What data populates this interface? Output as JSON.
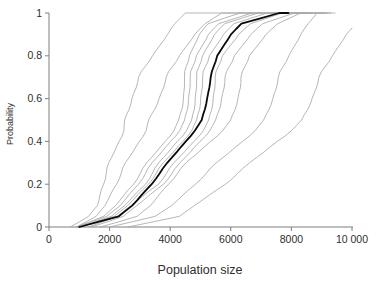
{
  "chart_data": {
    "type": "line",
    "subtype": "empirical-cdf",
    "title": "",
    "xlabel": "Population size",
    "ylabel": "Probability",
    "xlim": [
      0,
      10000
    ],
    "ylim": [
      0,
      1
    ],
    "grid": false,
    "legend": "none",
    "n_series": 12,
    "x_ticks": {
      "values": [
        0,
        2000,
        4000,
        6000,
        8000,
        10000
      ],
      "labels": [
        "0",
        "2000",
        "4000",
        "6000",
        "8000",
        "10 000"
      ]
    },
    "y_ticks": {
      "values": [
        0,
        0.2,
        0.4,
        0.6,
        0.8,
        1
      ],
      "labels": [
        "0",
        "0.2",
        "0.4",
        "0.6",
        "0.8",
        "1"
      ]
    },
    "series": [
      {
        "name": "replicate-1",
        "role": "replicate",
        "color": "#a3a3a3",
        "width": 0.8,
        "points": [
          [
            700,
            0
          ],
          [
            1300,
            0.05
          ],
          [
            1600,
            0.1
          ],
          [
            1815,
            0.2
          ],
          [
            2050,
            0.3
          ],
          [
            2280,
            0.4
          ],
          [
            2508,
            0.5
          ],
          [
            2750,
            0.6
          ],
          [
            3050,
            0.7
          ],
          [
            3400,
            0.8
          ],
          [
            3900,
            0.9
          ],
          [
            4150,
            0.95
          ],
          [
            4500,
            1
          ],
          [
            6700,
            1
          ]
        ]
      },
      {
        "name": "replicate-2",
        "role": "replicate",
        "color": "#a3a3a3",
        "width": 0.8,
        "points": [
          [
            900,
            0
          ],
          [
            1550,
            0.05
          ],
          [
            1850,
            0.1
          ],
          [
            2244,
            0.2
          ],
          [
            2600,
            0.3
          ],
          [
            2950,
            0.4
          ],
          [
            3300,
            0.5
          ],
          [
            3650,
            0.6
          ],
          [
            3960,
            0.7
          ],
          [
            4290,
            0.8
          ],
          [
            4800,
            0.9
          ],
          [
            5150,
            0.95
          ],
          [
            5700,
            1
          ],
          [
            7000,
            1
          ]
        ]
      },
      {
        "name": "replicate-3",
        "role": "replicate",
        "color": "#a3a3a3",
        "width": 0.8,
        "points": [
          [
            900,
            0
          ],
          [
            1800,
            0.05
          ],
          [
            2200,
            0.1
          ],
          [
            2805,
            0.2
          ],
          [
            3300,
            0.3
          ],
          [
            3800,
            0.4
          ],
          [
            4290,
            0.5
          ],
          [
            4450,
            0.6
          ],
          [
            4540,
            0.7
          ],
          [
            4620,
            0.8
          ],
          [
            4950,
            0.9
          ],
          [
            5250,
            0.95
          ],
          [
            6300,
            1
          ],
          [
            7800,
            1
          ]
        ]
      },
      {
        "name": "replicate-4",
        "role": "replicate",
        "color": "#a3a3a3",
        "width": 0.8,
        "points": [
          [
            950,
            0
          ],
          [
            1900,
            0.05
          ],
          [
            2350,
            0.1
          ],
          [
            2970,
            0.2
          ],
          [
            3480,
            0.3
          ],
          [
            3980,
            0.4
          ],
          [
            4488,
            0.5
          ],
          [
            4620,
            0.6
          ],
          [
            4740,
            0.7
          ],
          [
            4851,
            0.8
          ],
          [
            5250,
            0.9
          ],
          [
            5600,
            0.95
          ],
          [
            6700,
            1
          ],
          [
            8300,
            1
          ]
        ]
      },
      {
        "name": "replicate-5",
        "role": "replicate",
        "color": "#a3a3a3",
        "width": 0.8,
        "points": [
          [
            1000,
            0
          ],
          [
            2050,
            0.05
          ],
          [
            2500,
            0.1
          ],
          [
            3201,
            0.2
          ],
          [
            3700,
            0.3
          ],
          [
            4200,
            0.4
          ],
          [
            4719,
            0.5
          ],
          [
            4840,
            0.6
          ],
          [
            4950,
            0.7
          ],
          [
            5050,
            0.8
          ],
          [
            5450,
            0.9
          ],
          [
            5800,
            0.95
          ],
          [
            6900,
            1
          ],
          [
            8800,
            1
          ]
        ]
      },
      {
        "name": "replicate-6",
        "role": "replicate",
        "color": "#a3a3a3",
        "width": 0.8,
        "points": [
          [
            1050,
            0
          ],
          [
            2150,
            0.05
          ],
          [
            2600,
            0.1
          ],
          [
            3300,
            0.2
          ],
          [
            3850,
            0.3
          ],
          [
            4380,
            0.4
          ],
          [
            4884,
            0.5
          ],
          [
            5020,
            0.6
          ],
          [
            5150,
            0.7
          ],
          [
            5280,
            0.8
          ],
          [
            5750,
            0.9
          ],
          [
            6100,
            0.95
          ],
          [
            7200,
            1
          ],
          [
            9100,
            1
          ]
        ]
      },
      {
        "name": "replicate-7",
        "role": "replicate",
        "color": "#a3a3a3",
        "width": 0.8,
        "points": [
          [
            1300,
            0
          ],
          [
            2250,
            0.05
          ],
          [
            2700,
            0.1
          ],
          [
            3630,
            0.2
          ],
          [
            4200,
            0.3
          ],
          [
            4750,
            0.4
          ],
          [
            5280,
            0.5
          ],
          [
            5430,
            0.6
          ],
          [
            5570,
            0.7
          ],
          [
            5709,
            0.8
          ],
          [
            6250,
            0.9
          ],
          [
            6650,
            0.95
          ],
          [
            7700,
            1
          ],
          [
            9300,
            1
          ]
        ]
      },
      {
        "name": "replicate-8",
        "role": "replicate",
        "color": "#a3a3a3",
        "width": 0.8,
        "points": [
          [
            1400,
            0
          ],
          [
            2450,
            0.05
          ],
          [
            2900,
            0.1
          ],
          [
            3795,
            0.2
          ],
          [
            4400,
            0.3
          ],
          [
            4950,
            0.4
          ],
          [
            5512,
            0.5
          ],
          [
            5710,
            0.6
          ],
          [
            5900,
            0.7
          ],
          [
            6105,
            0.8
          ],
          [
            6650,
            0.9
          ],
          [
            7050,
            0.95
          ],
          [
            8100,
            1
          ],
          [
            9440,
            1
          ]
        ]
      },
      {
        "name": "replicate-9",
        "role": "replicate",
        "color": "#a3a3a3",
        "width": 0.8,
        "points": [
          [
            1700,
            0
          ],
          [
            2900,
            0.05
          ],
          [
            3350,
            0.1
          ],
          [
            3960,
            0.2
          ],
          [
            4600,
            0.3
          ],
          [
            5300,
            0.4
          ],
          [
            6006,
            0.5
          ],
          [
            6250,
            0.6
          ],
          [
            6430,
            0.7
          ],
          [
            6600,
            0.8
          ],
          [
            7150,
            0.9
          ],
          [
            7550,
            0.95
          ],
          [
            8300,
            1
          ],
          [
            8600,
            1
          ]
        ]
      },
      {
        "name": "replicate-10",
        "role": "replicate",
        "color": "#a3a3a3",
        "width": 0.8,
        "points": [
          [
            2000,
            0
          ],
          [
            3500,
            0.05
          ],
          [
            4050,
            0.1
          ],
          [
            4851,
            0.2
          ],
          [
            5600,
            0.3
          ],
          [
            6350,
            0.4
          ],
          [
            7095,
            0.5
          ],
          [
            7400,
            0.6
          ],
          [
            7660,
            0.7
          ],
          [
            7900,
            0.8
          ],
          [
            8300,
            0.9
          ],
          [
            8550,
            0.95
          ],
          [
            8845,
            1
          ],
          [
            9200,
            1
          ]
        ]
      },
      {
        "name": "replicate-11",
        "role": "replicate",
        "color": "#a3a3a3",
        "width": 0.8,
        "points": [
          [
            2600,
            0
          ],
          [
            4300,
            0.05
          ],
          [
            4800,
            0.1
          ],
          [
            5841,
            0.2
          ],
          [
            6700,
            0.3
          ],
          [
            7500,
            0.4
          ],
          [
            8350,
            0.5
          ],
          [
            8700,
            0.6
          ],
          [
            9000,
            0.7
          ],
          [
            9340,
            0.8
          ],
          [
            9800,
            0.9
          ],
          [
            10000,
            0.93
          ]
        ]
      },
      {
        "name": "mean",
        "role": "mean",
        "color": "#0a0a0a",
        "width": 1.8,
        "points": [
          [
            1000,
            0
          ],
          [
            2300,
            0.05
          ],
          [
            2750,
            0.1
          ],
          [
            3400,
            0.2
          ],
          [
            3950,
            0.3
          ],
          [
            4500,
            0.4
          ],
          [
            5050,
            0.5
          ],
          [
            5230,
            0.6
          ],
          [
            5390,
            0.7
          ],
          [
            5545,
            0.8
          ],
          [
            6000,
            0.9
          ],
          [
            6350,
            0.95
          ],
          [
            7600,
            1
          ],
          [
            7900,
            1
          ]
        ]
      }
    ]
  },
  "colors": {
    "background": "#ffffff",
    "axis": "#7f7f7f",
    "text": "#2e2e2e",
    "thin_line": "#a3a3a3",
    "thick_line": "#0a0a0a"
  }
}
